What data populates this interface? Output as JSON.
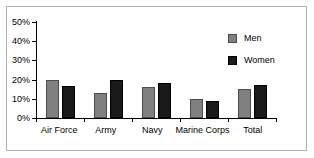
{
  "chart_data": {
    "type": "bar",
    "title": "",
    "subtitle": "",
    "xlabel": "",
    "ylabel": "",
    "categories": [
      "Air Force",
      "Army",
      "Navy",
      "Marine Corps",
      "Total"
    ],
    "series": [
      {
        "name": "Men",
        "color": "#808080",
        "values": [
          19.8,
          13,
          16,
          10,
          15
        ]
      },
      {
        "name": "Women",
        "color": "#1a1a1a",
        "values": [
          16.5,
          20,
          18,
          9,
          17
        ]
      }
    ],
    "ylim": [
      0,
      50
    ],
    "ytick_values": [
      0,
      10,
      20,
      30,
      40,
      50
    ],
    "ytick_labels": [
      "0%",
      "10%",
      "20%",
      "30%",
      "40%",
      "50%"
    ],
    "grid": false,
    "legend_position": "top-right",
    "annotations": []
  },
  "legend": {
    "entries": [
      {
        "label": "Men",
        "swatch": "men"
      },
      {
        "label": "Women",
        "swatch": "women"
      }
    ]
  }
}
